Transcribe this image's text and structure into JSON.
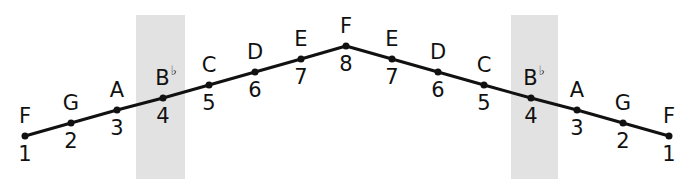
{
  "diagram": {
    "type": "scale-degree-arch",
    "line_color": "#111111",
    "highlight_color": "#e2e2e2",
    "highlight_bands": [
      {
        "label": "B♭ ascending",
        "x": 136,
        "y": 15,
        "width": 49,
        "height": 164
      },
      {
        "label": "B♭ descending",
        "x": 511,
        "y": 15,
        "width": 47,
        "height": 164
      }
    ],
    "points": [
      {
        "note": "F",
        "accidental": "",
        "degree": "1",
        "x": 25,
        "y": 136
      },
      {
        "note": "G",
        "accidental": "",
        "degree": "2",
        "x": 71,
        "y": 123
      },
      {
        "note": "A",
        "accidental": "",
        "degree": "3",
        "x": 117,
        "y": 110
      },
      {
        "note": "B",
        "accidental": "♭",
        "degree": "4",
        "x": 163,
        "y": 98
      },
      {
        "note": "C",
        "accidental": "",
        "degree": "5",
        "x": 209,
        "y": 85
      },
      {
        "note": "D",
        "accidental": "",
        "degree": "6",
        "x": 255,
        "y": 72
      },
      {
        "note": "E",
        "accidental": "",
        "degree": "7",
        "x": 301,
        "y": 59
      },
      {
        "note": "F",
        "accidental": "",
        "degree": "8",
        "x": 346,
        "y": 46
      },
      {
        "note": "E",
        "accidental": "",
        "degree": "7",
        "x": 392,
        "y": 59
      },
      {
        "note": "D",
        "accidental": "",
        "degree": "6",
        "x": 438,
        "y": 72
      },
      {
        "note": "C",
        "accidental": "",
        "degree": "5",
        "x": 484,
        "y": 85
      },
      {
        "note": "B",
        "accidental": "♭",
        "degree": "4",
        "x": 531,
        "y": 98
      },
      {
        "note": "A",
        "accidental": "",
        "degree": "3",
        "x": 577,
        "y": 110
      },
      {
        "note": "G",
        "accidental": "",
        "degree": "2",
        "x": 623,
        "y": 123
      },
      {
        "note": "F",
        "accidental": "",
        "degree": "1",
        "x": 669,
        "y": 136
      }
    ]
  }
}
